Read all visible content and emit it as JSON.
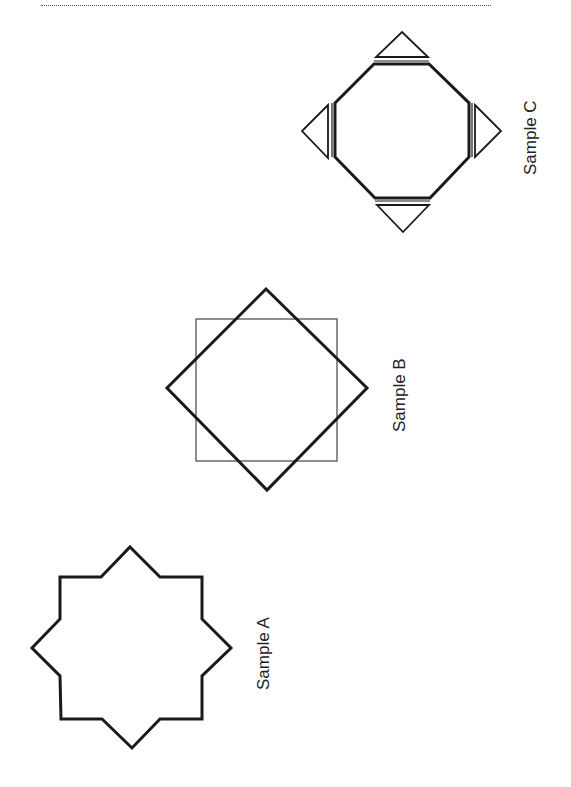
{
  "figure": {
    "samples": [
      {
        "id": "A",
        "label": "Sample A",
        "shape": "eight-point star (overlapping squares outline)"
      },
      {
        "id": "B",
        "label": "Sample B",
        "shape": "square with rotated square (diamond)"
      },
      {
        "id": "C",
        "label": "Sample C",
        "shape": "octagon with four triangles"
      }
    ]
  },
  "colors": {
    "stroke": "#1a1a1a",
    "thin_stroke": "#444444",
    "background": "#ffffff"
  }
}
